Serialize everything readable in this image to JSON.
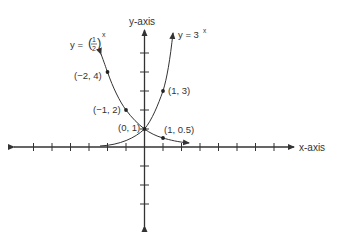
{
  "diagram": {
    "type": "coordinate-plane-exponential-functions",
    "x_axis_label": "x-axis",
    "y_axis_label": "y-axis",
    "curves": [
      {
        "name": "y = 3^x",
        "label_base": "y = 3",
        "label_exp": "x",
        "points": [
          "(1, 3)",
          "(0, 1)"
        ]
      },
      {
        "name": "y = (1/2)^x",
        "label_prefix": "y =",
        "label_num": "1",
        "label_den": "2",
        "label_exp": "x",
        "points": [
          "(-2, 4)",
          "(-1, 2)",
          "(0, 1)",
          "(1, 0.5)"
        ]
      }
    ],
    "point_labels": {
      "p_neg2_4": "(−2, 4)",
      "p_neg1_2": "(−1, 2)",
      "p_0_1": "(0, 1)",
      "p_1_3": "(1, 3)",
      "p_1_05": "(1, 0.5)"
    },
    "colors": {
      "ink": "#333333",
      "background": "#ffffff"
    }
  }
}
